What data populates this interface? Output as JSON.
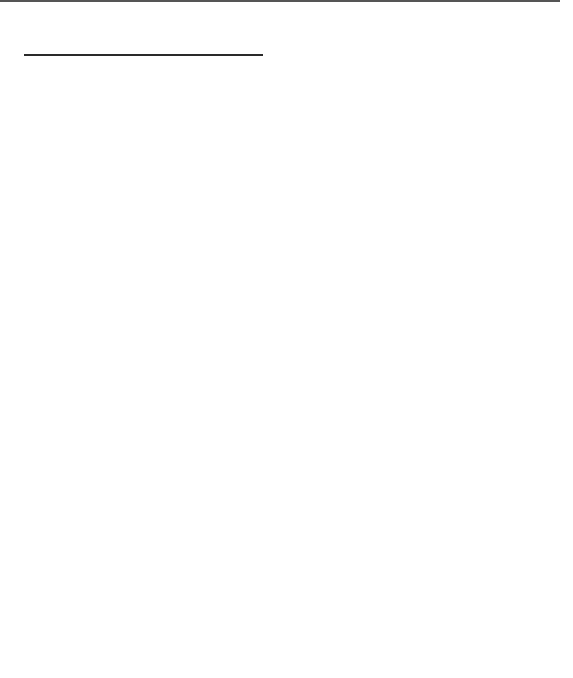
{
  "figure": {
    "time_axis": {
      "title": "Time in ms",
      "ticks": [
        "1",
        "2",
        "3",
        "4",
        "5",
        "6",
        "7",
        "8",
        "9",
        "10"
      ],
      "stimulus_label_line1": "60 dBHL",
      "stimulus_label_line2": "stimulus"
    },
    "latencies": [
      "1.9",
      "3.0",
      "4.1",
      "5.2",
      "5.8",
      "5.9",
      "7.6",
      "9.2"
    ],
    "amplitude_axis": {
      "top_label": "Cz+",
      "bottom_label": "Cz−",
      "scale_value": "0.1",
      "unit_label": "µV  units"
    },
    "peaks": [
      {
        "id": "I",
        "latency_ms": 1.9
      },
      {
        "id": "II",
        "latency_ms": 3.0
      },
      {
        "id": "III",
        "latency_ms": 4.1
      },
      {
        "id": "IV",
        "latency_ms": 5.2
      },
      {
        "id": "V",
        "latency_ms": 5.8
      },
      {
        "id": "VI",
        "latency_ms": 7.6
      },
      {
        "id": "VII",
        "latency_ms": 9.2
      }
    ],
    "generators": [
      {
        "numeral": "I",
        "line1": "Acoustic",
        "line2": "nerve (8th)",
        "line3": "",
        "line4": ""
      },
      {
        "numeral": "II",
        "line1": "Cochlear",
        "line2": "nuclei",
        "line3": "(medulla)",
        "line4": ""
      },
      {
        "numeral": "III",
        "line1": "Superior",
        "line2": "olivary",
        "line3": "complex",
        "line4": "(pons)"
      },
      {
        "numeral": "IV",
        "line1": "Lateral",
        "line2": "lemniscus",
        "line3": "(pons)",
        "line4": ""
      },
      {
        "numeral": "V",
        "line1": "Inferior",
        "line2": "colliculus",
        "line3": "(midbrain)",
        "line4": ""
      },
      {
        "numeral": "VI",
        "line1": "Medial",
        "line2": "geniculate",
        "line3": "(thalamus)",
        "line4": ""
      },
      {
        "numeral": "VII",
        "line1": "Auditory",
        "line2": "radiations",
        "line3": "(thalamo-",
        "line4": "cortical)"
      }
    ],
    "anatomy_labels": {
      "outer_hair_cells": [
        "Outer",
        "hair",
        "cells"
      ],
      "inner_hair_cell": [
        "Inner",
        "hair",
        "cell"
      ],
      "organ_of_corti": [
        "Organ of",
        "Corti"
      ],
      "superior_olivary_complex": [
        "Superior",
        "olivary",
        "complex"
      ],
      "pontomedullary_junction": [
        "Pontomed-",
        "ullary",
        "junction"
      ],
      "acoustic_nerve": [
        "Acoustic nerve"
      ],
      "nucleus_lateral_lemniscus": [
        "Nucleus of",
        "lateral",
        "lemniscus"
      ],
      "midbrain_level": [
        "Midbrain",
        "level"
      ],
      "ventral_cochlear_nucleus": [
        "Ventral",
        "cochlear",
        "nucleus"
      ],
      "dorsal_cochlear_nucleus": [
        "Dorsal",
        "cochlear",
        "nucleus"
      ],
      "inferior_colliculus": [
        "Inferior",
        "colliculus"
      ],
      "medial_geniculate_body": [
        "Medial",
        "geniculate",
        "body"
      ]
    },
    "colors": {
      "ink": "#2a2a2a",
      "rule": "#555555",
      "background": "#ffffff"
    }
  }
}
